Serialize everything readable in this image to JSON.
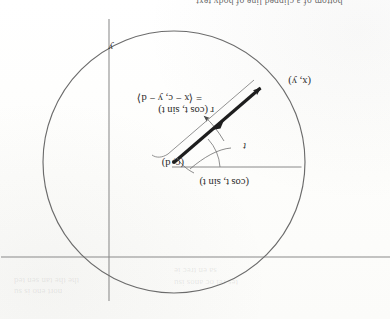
{
  "page": {
    "orientation": "upside-down-scan",
    "rotation_degrees": 180,
    "background_color": "#fdfdfc",
    "ink_color": "#2b2b2b"
  },
  "figure": {
    "caption_fragment_top": "bottom of a clipped line of body text",
    "circle": {
      "center_x": 216,
      "center_y": 157,
      "radius": 131,
      "stroke_color": "#6b6b6b"
    },
    "axes": {
      "horizontal_y": 62,
      "vertical_x": 281,
      "stroke_color": "#7a7a7a",
      "y_axis_label": "y"
    },
    "radius_guide": {
      "from_x": 88,
      "from_y": 152,
      "to_x": 216,
      "to_y": 152
    },
    "vector": {
      "tail_x": 216,
      "tail_y": 157,
      "head_x": 128,
      "head_y": 232,
      "stroke_color": "#1e1e1e"
    }
  },
  "labels": {
    "center_point": "(c, d)",
    "terminal_point": "(x, y)",
    "unit_vector": "(cos t, sin t)",
    "angle": "t",
    "axis_y": "y",
    "equation_line1": "r (cos t, sin t)",
    "equation_line2": "= ⟨x − c, y − d⟩",
    "equation_r": "r"
  },
  "bleed_through": {
    "line1": "the the tan sen ted",
    "line2": "nort eno is su",
    "line3": "sa en trec ie",
    "line4": "tes rel oc anos isu"
  }
}
